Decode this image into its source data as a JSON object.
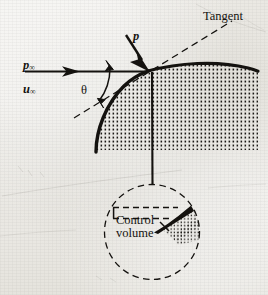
{
  "figure": {
    "background_color": "#e8e7e2",
    "ink_color": "#14120f"
  },
  "labels": {
    "freestream_pressure": "p",
    "freestream_pressure_sub": "∞",
    "freestream_velocity": "u",
    "freestream_velocity_sub": "∞",
    "angle": "θ",
    "surface_pressure": "p",
    "tangent": "Tangent",
    "control_volume_line1": "Control",
    "control_volume_line2": "volume"
  },
  "geometry": {
    "freestream_line": {
      "x1": 25,
      "y1": 71,
      "x2": 148,
      "y2": 71
    },
    "freestream_arrowhead_x": 75,
    "stagnation_point": {
      "x": 148,
      "y": 71
    },
    "tangent_line": {
      "x1": 74,
      "y1": 117,
      "x2": 230,
      "y2": 22,
      "style": "dashed"
    },
    "angle_arc_label_position": {
      "x": 87,
      "y": 90
    },
    "pressure_arrow": {
      "x1": 130,
      "y1": 40,
      "x2": 148,
      "y2": 70
    },
    "body_outline": "thick curve from (98,150) through (148,71) to (258,69)",
    "leader_line": {
      "x1": 152,
      "y1": 71,
      "x2": 152,
      "y2": 184
    },
    "inset_circle": {
      "cx": 152,
      "cy": 232,
      "r": 48,
      "style": "dashed"
    },
    "cv_rectangle": {
      "x": 113,
      "y": 207,
      "w": 65,
      "h": 11,
      "style": "dashed"
    },
    "cv_wedge": "thick tapered black wedge from (155,230) to (192,203)"
  },
  "style_notes": {
    "body_fill": "stipple dot texture",
    "line_weight_thick": 3.2,
    "line_weight_thin": 1.0,
    "dash_pattern": "6 4"
  }
}
